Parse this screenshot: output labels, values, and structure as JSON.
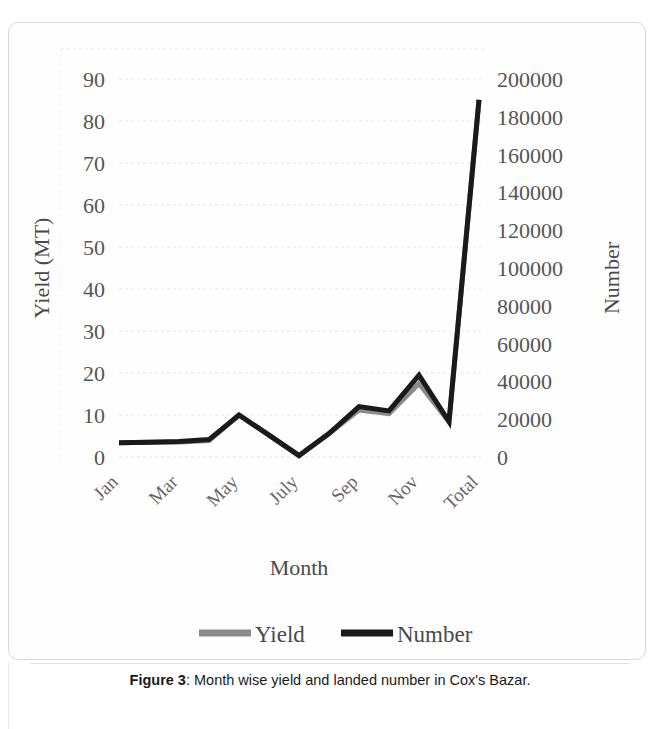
{
  "figure": {
    "caption_prefix": "Figure 3",
    "caption_sep": ": ",
    "caption_text": "Month wise yield and landed number in Cox's Bazar."
  },
  "chart_data": {
    "type": "line",
    "title": "",
    "xlabel": "Month",
    "ylabel": "Yield (MT)",
    "y2label": "Number",
    "categories": [
      "Jan",
      "Feb",
      "Mar",
      "Apr",
      "May",
      "June",
      "July",
      "Aug",
      "Sep",
      "Oct",
      "Nov",
      "Dec",
      "Total"
    ],
    "visible_tick_labels": [
      "Jan",
      "Mar",
      "May",
      "July",
      "Sep",
      "Nov",
      "Total"
    ],
    "ylim": [
      0,
      90
    ],
    "y2lim": [
      0,
      200000
    ],
    "yticks": [
      0,
      10,
      20,
      30,
      40,
      50,
      60,
      70,
      80,
      90
    ],
    "ytick_labels": [
      "0",
      "10",
      "20",
      "30",
      "40",
      "50",
      "60",
      "70",
      "80",
      "90"
    ],
    "y2ticks": [
      0,
      20000,
      40000,
      60000,
      80000,
      100000,
      120000,
      140000,
      160000,
      180000,
      200000
    ],
    "y2tick_labels": [
      "0",
      "20000",
      "40000",
      "60000",
      "80000",
      "100000",
      "120000",
      "140000",
      "160000",
      "180000",
      "200000"
    ],
    "grid": true,
    "legend_position": "bottom",
    "series": [
      {
        "name": "Yield",
        "axis": "left",
        "color": "#8a8a8a",
        "values": [
          3.4,
          3.5,
          3.6,
          3.9,
          10.0,
          5.2,
          0.4,
          5.6,
          11.2,
          10.3,
          17.5,
          8.4,
          85.0
        ]
      },
      {
        "name": "Number",
        "axis": "right",
        "color": "#1a1a1a",
        "values": [
          7600,
          7800,
          8200,
          9200,
          22200,
          11600,
          700,
          12400,
          26700,
          24400,
          43300,
          18700,
          189000
        ]
      }
    ]
  },
  "legend": {
    "items": [
      {
        "label": "Yield",
        "color": "#8a8a8a"
      },
      {
        "label": "Number",
        "color": "#1a1a1a"
      }
    ]
  }
}
